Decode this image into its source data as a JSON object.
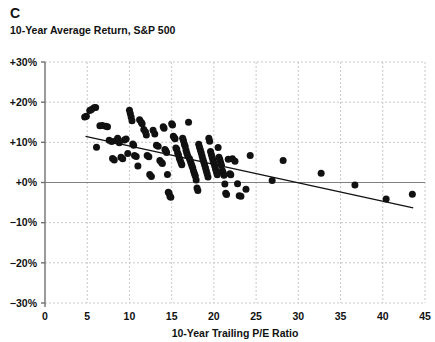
{
  "panel": {
    "letter": "C",
    "subtitle": "10-Year Average Return, S&P 500"
  },
  "colors": {
    "point": "#111111",
    "trendline": "#111111",
    "zero_line": "#808080",
    "grid": "#c8c8c8",
    "axis": "#707070",
    "text": "#111111",
    "background": "#ffffff"
  },
  "chart_data": {
    "type": "scatter",
    "title": "C",
    "subtitle": "10-Year Average Return, S&P 500",
    "xlabel": "10-Year Trailing P/E Ratio",
    "ylabel": "",
    "xlim": [
      0,
      45
    ],
    "ylim": [
      -30,
      30
    ],
    "xticks": [
      0,
      5,
      10,
      15,
      20,
      25,
      30,
      35,
      40,
      45
    ],
    "yticks": [
      -30,
      -20,
      -10,
      0,
      10,
      20,
      30
    ],
    "xtick_labels": [
      "0",
      "5",
      "10",
      "15",
      "20",
      "25",
      "30",
      "35",
      "40",
      "45"
    ],
    "ytick_labels": [
      "−30%",
      "−20%",
      "−10%",
      "+0%",
      "+10%",
      "+20%",
      "+30%"
    ],
    "grid": true,
    "grid_style": "dashed",
    "legend": "none",
    "zero_line": 0,
    "marker_size": 7,
    "trendline": {
      "type": "linear",
      "x_start": 4.8,
      "y_start": 11.5,
      "x_end": 43.6,
      "y_end": -6.3,
      "slope": -0.459,
      "intercept": 13.7
    },
    "points": [
      [
        4.7,
        16.3
      ],
      [
        4.9,
        16.5
      ],
      [
        5.3,
        17.9
      ],
      [
        5.5,
        18.2
      ],
      [
        5.8,
        18.6
      ],
      [
        6.0,
        18.7
      ],
      [
        6.1,
        8.8
      ],
      [
        6.5,
        14.1
      ],
      [
        6.8,
        14.2
      ],
      [
        7.2,
        14.0
      ],
      [
        7.4,
        13.9
      ],
      [
        7.6,
        10.5
      ],
      [
        7.9,
        10.2
      ],
      [
        8.0,
        6.0
      ],
      [
        8.2,
        5.6
      ],
      [
        8.4,
        10.4
      ],
      [
        8.6,
        11.0
      ],
      [
        8.8,
        9.9
      ],
      [
        9.0,
        6.3
      ],
      [
        9.2,
        5.9
      ],
      [
        9.4,
        10.6
      ],
      [
        9.6,
        10.8
      ],
      [
        9.8,
        7.2
      ],
      [
        10.0,
        18.0
      ],
      [
        10.1,
        17.2
      ],
      [
        10.2,
        16.3
      ],
      [
        10.3,
        15.4
      ],
      [
        10.4,
        9.6
      ],
      [
        10.5,
        9.3
      ],
      [
        10.6,
        6.7
      ],
      [
        10.8,
        6.5
      ],
      [
        11.0,
        4.1
      ],
      [
        11.2,
        15.6
      ],
      [
        11.4,
        15.0
      ],
      [
        11.5,
        14.6
      ],
      [
        11.7,
        13.2
      ],
      [
        11.9,
        12.6
      ],
      [
        12.0,
        11.8
      ],
      [
        12.1,
        6.7
      ],
      [
        12.3,
        6.4
      ],
      [
        12.4,
        2.0
      ],
      [
        12.6,
        1.5
      ],
      [
        12.8,
        13.0
      ],
      [
        13.0,
        12.1
      ],
      [
        13.2,
        9.3
      ],
      [
        13.4,
        9.0
      ],
      [
        13.6,
        5.5
      ],
      [
        13.8,
        5.0
      ],
      [
        13.9,
        4.7
      ],
      [
        14.0,
        13.9
      ],
      [
        14.1,
        13.5
      ],
      [
        14.2,
        8.2
      ],
      [
        14.3,
        7.9
      ],
      [
        14.4,
        7.5
      ],
      [
        14.5,
        2.0
      ],
      [
        14.6,
        -2.4
      ],
      [
        14.7,
        -2.7
      ],
      [
        14.8,
        -3.5
      ],
      [
        14.9,
        -3.7
      ],
      [
        15.0,
        14.6
      ],
      [
        15.1,
        14.3
      ],
      [
        15.2,
        11.5
      ],
      [
        15.3,
        11.2
      ],
      [
        15.4,
        10.9
      ],
      [
        15.5,
        8.6
      ],
      [
        15.6,
        8.3
      ],
      [
        15.7,
        7.4
      ],
      [
        15.8,
        6.9
      ],
      [
        15.9,
        6.1
      ],
      [
        16.0,
        5.6
      ],
      [
        16.1,
        5.0
      ],
      [
        16.2,
        4.4
      ],
      [
        16.3,
        11.0
      ],
      [
        16.4,
        10.4
      ],
      [
        16.5,
        9.6
      ],
      [
        16.6,
        9.0
      ],
      [
        16.7,
        8.0
      ],
      [
        16.8,
        7.3
      ],
      [
        16.9,
        6.6
      ],
      [
        17.0,
        15.0
      ],
      [
        17.1,
        6.0
      ],
      [
        17.2,
        5.4
      ],
      [
        17.3,
        4.8
      ],
      [
        17.4,
        4.2
      ],
      [
        17.5,
        3.6
      ],
      [
        17.6,
        2.8
      ],
      [
        17.7,
        2.2
      ],
      [
        17.8,
        1.6
      ],
      [
        17.9,
        0.6
      ],
      [
        18.0,
        -1.4
      ],
      [
        18.1,
        -2.0
      ],
      [
        18.2,
        9.5
      ],
      [
        18.3,
        8.8
      ],
      [
        18.4,
        8.1
      ],
      [
        18.5,
        7.4
      ],
      [
        18.6,
        6.6
      ],
      [
        18.7,
        5.8
      ],
      [
        18.8,
        5.1
      ],
      [
        18.9,
        4.4
      ],
      [
        19.0,
        3.7
      ],
      [
        19.1,
        2.9
      ],
      [
        19.2,
        2.2
      ],
      [
        19.3,
        1.4
      ],
      [
        19.4,
        11.0
      ],
      [
        19.5,
        10.3
      ],
      [
        19.6,
        7.7
      ],
      [
        19.7,
        7.0
      ],
      [
        19.8,
        6.2
      ],
      [
        19.9,
        5.5
      ],
      [
        20.0,
        4.8
      ],
      [
        20.1,
        4.1
      ],
      [
        20.2,
        3.3
      ],
      [
        20.3,
        2.6
      ],
      [
        20.4,
        1.9
      ],
      [
        20.5,
        8.7
      ],
      [
        20.6,
        6.3
      ],
      [
        20.7,
        5.7
      ],
      [
        20.8,
        5.0
      ],
      [
        20.9,
        4.3
      ],
      [
        21.0,
        3.0
      ],
      [
        21.1,
        2.4
      ],
      [
        21.2,
        1.8
      ],
      [
        21.3,
        -0.4
      ],
      [
        21.4,
        -2.7
      ],
      [
        21.5,
        -3.0
      ],
      [
        21.7,
        5.8
      ],
      [
        21.9,
        2.2
      ],
      [
        22.0,
        1.9
      ],
      [
        22.2,
        5.9
      ],
      [
        22.5,
        5.3
      ],
      [
        22.8,
        -0.3
      ],
      [
        23.0,
        -3.3
      ],
      [
        23.2,
        -3.4
      ],
      [
        23.8,
        -1.7
      ],
      [
        24.3,
        6.7
      ],
      [
        26.9,
        0.5
      ],
      [
        28.2,
        5.5
      ],
      [
        32.7,
        2.3
      ],
      [
        36.7,
        -0.6
      ],
      [
        40.4,
        -4.1
      ],
      [
        43.5,
        -2.9
      ]
    ]
  },
  "axis": {
    "x_title": "10-Year Trailing P/E Ratio"
  }
}
